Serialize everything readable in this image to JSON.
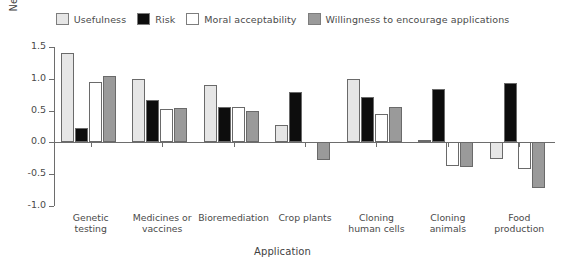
{
  "chart_data": {
    "type": "bar",
    "title": "",
    "xlabel": "Application",
    "ylabel": "Negative/positive evaluation (−2 to +2)",
    "ylim": [
      -1.0,
      1.5
    ],
    "yticks": [
      1.5,
      1.0,
      0.5,
      0.0,
      -0.5,
      -1.0
    ],
    "ytick_labels": [
      "1.5",
      "1.0",
      "0.5",
      "0.0",
      "-0.5",
      "-1.0"
    ],
    "grid": false,
    "legend_position": "top-center",
    "categories": [
      "Genetic testing",
      "Medicines or vaccines",
      "Bioremediation",
      "Crop plants",
      "Cloning human cells",
      "Cloning animals",
      "Food production"
    ],
    "category_lines": [
      [
        "Genetic",
        "testing"
      ],
      [
        "Medicines or",
        "vaccines"
      ],
      [
        "Bioremediation",
        ""
      ],
      [
        "Crop plants",
        ""
      ],
      [
        "Cloning",
        "human cells"
      ],
      [
        "Cloning",
        "animals"
      ],
      [
        "Food",
        "production"
      ]
    ],
    "series": [
      {
        "name": "Usefulness",
        "color": "#e6e6e6",
        "values": [
          1.4,
          1.0,
          0.9,
          0.27,
          1.0,
          0.03,
          -0.26
        ]
      },
      {
        "name": "Risk",
        "color": "#0d0d0d",
        "values": [
          0.22,
          0.66,
          0.56,
          0.79,
          0.72,
          0.84,
          0.94
        ]
      },
      {
        "name": "Moral acceptability",
        "color": "#ffffff",
        "values": [
          0.95,
          0.52,
          0.55,
          0.0,
          0.44,
          -0.37,
          -0.42
        ]
      },
      {
        "name": "Willingness to encourage applications",
        "color": "#9a9a9a",
        "values": [
          1.05,
          0.54,
          0.49,
          -0.27,
          0.55,
          -0.38,
          -0.71
        ]
      }
    ]
  },
  "legend": {
    "items": [
      {
        "label": "Usefulness",
        "color": "#e6e6e6"
      },
      {
        "label": "Risk",
        "color": "#0d0d0d"
      },
      {
        "label": "Moral acceptability",
        "color": "#ffffff"
      },
      {
        "label": "Willingness to encourage applications",
        "color": "#9a9a9a"
      }
    ]
  },
  "axes": {
    "y_title": "Negative/positive evaluation (−2 to +2)",
    "x_title": "Application",
    "y_tick_labels": [
      "1.5",
      "1.0",
      "0.5",
      "0.0",
      "-0.5",
      "-1.0"
    ]
  }
}
